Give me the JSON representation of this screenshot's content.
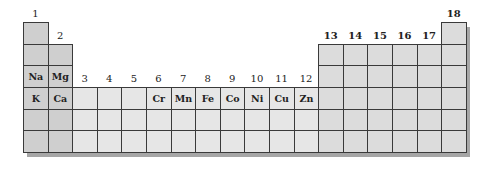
{
  "figure": {
    "colors": {
      "s_block": "#cfcfcf",
      "d_block": "#e6e6e6",
      "p_block": "#dcdcdc",
      "grid_line": "#3a3a3a",
      "shadow": "#a6a6a6"
    },
    "group_labels": [
      "1",
      "2",
      "3",
      "4",
      "5",
      "6",
      "7",
      "8",
      "9",
      "10",
      "11",
      "12",
      "13",
      "14",
      "15",
      "16",
      "17",
      "18"
    ],
    "period_3_elements": [
      {
        "group": 1,
        "symbol": "Na"
      },
      {
        "group": 2,
        "symbol": "Mg"
      }
    ],
    "period_4_elements": [
      {
        "group": 1,
        "symbol": "K"
      },
      {
        "group": 2,
        "symbol": "Ca"
      },
      {
        "group": 3,
        "symbol": ""
      },
      {
        "group": 4,
        "symbol": ""
      },
      {
        "group": 5,
        "symbol": ""
      },
      {
        "group": 6,
        "symbol": "Cr"
      },
      {
        "group": 7,
        "symbol": "Mn"
      },
      {
        "group": 8,
        "symbol": "Fe"
      },
      {
        "group": 9,
        "symbol": "Co"
      },
      {
        "group": 10,
        "symbol": "Ni"
      },
      {
        "group": 11,
        "symbol": "Cu"
      },
      {
        "group": 12,
        "symbol": "Zn"
      }
    ]
  }
}
